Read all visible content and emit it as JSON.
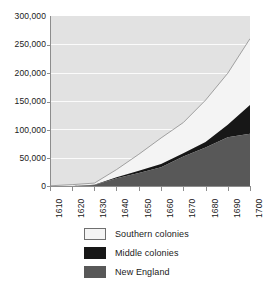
{
  "chart_data": {
    "type": "area",
    "title": "",
    "subtitle": "",
    "xlabel": "",
    "ylabel": "",
    "stacked": true,
    "grid": true,
    "legend_position": "bottom",
    "x": [
      1610,
      1620,
      1630,
      1640,
      1650,
      1660,
      1670,
      1680,
      1690,
      1700
    ],
    "categories": [
      "1610",
      "1620",
      "1630",
      "1640",
      "1650",
      "1660",
      "1670",
      "1680",
      "1690",
      "1700"
    ],
    "xlim": [
      1610,
      1700
    ],
    "ylim": [
      0,
      300000
    ],
    "ytick_values": [
      0,
      50000,
      100000,
      150000,
      200000,
      250000,
      300000
    ],
    "ytick_labels": [
      "0",
      "50,000",
      "100,000",
      "150,000",
      "200,000",
      "250,000",
      "300,000"
    ],
    "series": [
      {
        "name": "New England",
        "color": "#585858",
        "values": [
          0,
          100,
          1800,
          13700,
          23000,
          33000,
          52000,
          68000,
          86000,
          92000
        ]
      },
      {
        "name": "Middle colonies",
        "color": "#171717",
        "values": [
          0,
          0,
          350,
          1900,
          4100,
          5800,
          6000,
          9500,
          22000,
          51000
        ]
      },
      {
        "name": "Southern colonies",
        "color": "#f4f4f4",
        "values": [
          350,
          2300,
          3000,
          13500,
          29000,
          46000,
          54000,
          74000,
          91000,
          117000
        ]
      }
    ],
    "totals": [
      350,
      2400,
      5150,
      29100,
      56100,
      84800,
      112000,
      151500,
      199000,
      260000
    ]
  },
  "legend": {
    "items": [
      {
        "label": "Southern colonies",
        "swatch": "light-gray-swatch"
      },
      {
        "label": "Middle colonies",
        "swatch": "black-swatch"
      },
      {
        "label": "New England",
        "swatch": "dark-gray-swatch"
      }
    ]
  },
  "colors": {
    "plot_background": "#e2e2e2",
    "gridline": "#fbfbfb",
    "axis": "#8d8d8d",
    "text": "#1a1a1a",
    "southern": "#f4f4f4",
    "middle": "#171717",
    "new_england": "#585858",
    "page_background": "#ffffff"
  }
}
